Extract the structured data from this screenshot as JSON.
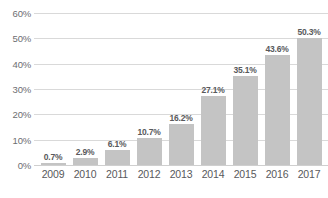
{
  "chart_data": {
    "type": "bar",
    "title": "",
    "xlabel": "",
    "ylabel": "",
    "categories": [
      "2009",
      "2010",
      "2011",
      "2012",
      "2013",
      "2014",
      "2015",
      "2016",
      "2017"
    ],
    "values": [
      0.7,
      2.9,
      6.1,
      10.7,
      16.2,
      27.1,
      35.1,
      43.6,
      50.3
    ],
    "data_labels": [
      "0.7%",
      "2.9%",
      "6.1%",
      "10.7%",
      "16.2%",
      "27.1%",
      "35.1%",
      "43.6%",
      "50.3%"
    ],
    "ylim": [
      0,
      60
    ],
    "y_ticks": [
      0,
      10,
      20,
      30,
      40,
      50,
      60
    ],
    "y_tick_labels": [
      "0%",
      "10%",
      "20%",
      "30%",
      "40%",
      "50%",
      "60%"
    ],
    "grid": true,
    "legend": false,
    "bar_color": "#c4c4c4",
    "gridline_color": "#d9d9d9",
    "label_color": "#58595b",
    "axis_text_color": "#6d6e71",
    "background_color": "#ffffff"
  }
}
